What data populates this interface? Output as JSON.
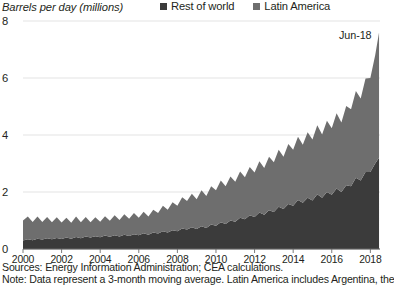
{
  "header": {
    "axis_title": "Barrels per day (millions)"
  },
  "legend": {
    "position": "top-right",
    "items": [
      {
        "label": "Rest of world",
        "color": "#3b3b3b",
        "icon": "square-swatch-icon"
      },
      {
        "label": "Latin America",
        "color": "#6e6e6e",
        "icon": "square-swatch-icon"
      }
    ]
  },
  "annotations": [
    {
      "text": "Jun-18",
      "x": "2018.45",
      "y": 7.6
    }
  ],
  "footer": {
    "sources": "Sources: Energy Information Administration; CEA calculations.",
    "note": "Note: Data represent a 3-month moving average. Latin America includes Argentina, the"
  },
  "chart_data": {
    "type": "area",
    "stacked": true,
    "title": "",
    "subtitle": "",
    "xlabel": "",
    "ylabel": "Barrels per day (millions)",
    "xlim": [
      2000,
      2018.5
    ],
    "ylim": [
      0,
      8
    ],
    "yticks": [
      0,
      2,
      4,
      6,
      8
    ],
    "ytick_labels": [
      "0",
      "2",
      "4",
      "6",
      "8"
    ],
    "xticks": [
      2000,
      2002,
      2004,
      2006,
      2008,
      2010,
      2012,
      2014,
      2016,
      2018
    ],
    "xtick_labels": [
      "2000",
      "2002",
      "2004",
      "2006",
      "2008",
      "2010",
      "2012",
      "2014",
      "2016",
      "2018"
    ],
    "grid": "horizontal",
    "legend_position": "top-right",
    "x": [
      2000.0,
      2000.25,
      2000.5,
      2000.75,
      2001.0,
      2001.25,
      2001.5,
      2001.75,
      2002.0,
      2002.25,
      2002.5,
      2002.75,
      2003.0,
      2003.25,
      2003.5,
      2003.75,
      2004.0,
      2004.25,
      2004.5,
      2004.75,
      2005.0,
      2005.25,
      2005.5,
      2005.75,
      2006.0,
      2006.25,
      2006.5,
      2006.75,
      2007.0,
      2007.25,
      2007.5,
      2007.75,
      2008.0,
      2008.25,
      2008.5,
      2008.75,
      2009.0,
      2009.25,
      2009.5,
      2009.75,
      2010.0,
      2010.25,
      2010.5,
      2010.75,
      2011.0,
      2011.25,
      2011.5,
      2011.75,
      2012.0,
      2012.25,
      2012.5,
      2012.75,
      2013.0,
      2013.25,
      2013.5,
      2013.75,
      2014.0,
      2014.25,
      2014.5,
      2014.75,
      2015.0,
      2015.25,
      2015.5,
      2015.75,
      2016.0,
      2016.25,
      2016.5,
      2016.75,
      2017.0,
      2017.25,
      2017.5,
      2017.75,
      2018.0,
      2018.25,
      2018.45
    ],
    "series": [
      {
        "name": "Rest of world",
        "color": "#3b3b3b",
        "values": [
          0.3,
          0.34,
          0.31,
          0.36,
          0.33,
          0.38,
          0.34,
          0.39,
          0.35,
          0.4,
          0.36,
          0.42,
          0.38,
          0.44,
          0.4,
          0.45,
          0.41,
          0.47,
          0.43,
          0.48,
          0.44,
          0.5,
          0.46,
          0.52,
          0.48,
          0.55,
          0.5,
          0.58,
          0.54,
          0.62,
          0.58,
          0.66,
          0.62,
          0.72,
          0.68,
          0.76,
          0.7,
          0.8,
          0.74,
          0.86,
          0.82,
          0.94,
          0.88,
          1.0,
          0.96,
          1.1,
          1.04,
          1.18,
          1.12,
          1.28,
          1.2,
          1.36,
          1.3,
          1.48,
          1.4,
          1.58,
          1.52,
          1.72,
          1.62,
          1.8,
          1.7,
          1.92,
          1.8,
          2.0,
          1.9,
          2.12,
          2.0,
          2.24,
          2.2,
          2.5,
          2.4,
          2.7,
          2.7,
          3.0,
          3.2
        ]
      },
      {
        "name": "Latin America",
        "color": "#6e6e6e",
        "values": [
          0.7,
          0.8,
          0.64,
          0.78,
          0.62,
          0.74,
          0.6,
          0.72,
          0.58,
          0.7,
          0.56,
          0.72,
          0.56,
          0.68,
          0.54,
          0.66,
          0.55,
          0.68,
          0.56,
          0.7,
          0.58,
          0.72,
          0.6,
          0.74,
          0.62,
          0.76,
          0.64,
          0.8,
          0.72,
          0.9,
          0.8,
          0.98,
          0.9,
          1.1,
          1.0,
          1.18,
          1.05,
          1.26,
          1.12,
          1.34,
          1.24,
          1.46,
          1.32,
          1.54,
          1.4,
          1.62,
          1.48,
          1.7,
          1.56,
          1.8,
          1.64,
          1.88,
          1.74,
          2.0,
          1.84,
          2.1,
          1.96,
          2.22,
          2.04,
          2.3,
          2.14,
          2.42,
          2.22,
          2.5,
          2.34,
          2.64,
          2.44,
          2.78,
          2.7,
          3.04,
          2.88,
          3.28,
          3.3,
          3.8,
          4.4
        ]
      }
    ]
  }
}
